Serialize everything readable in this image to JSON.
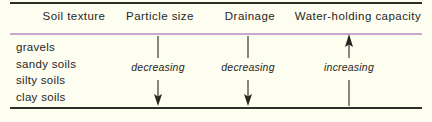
{
  "figure": {
    "background_color": "#fdfdf0",
    "rule_color": "#2e2e28",
    "accent_rule_color": "#c9a8cd",
    "text_color": "#26261f"
  },
  "columns": [
    {
      "header": "Soil texture"
    },
    {
      "header": "Particle size"
    },
    {
      "header": "Drainage"
    },
    {
      "header": "Water-holding capacity"
    }
  ],
  "soil_types": [
    "gravels",
    "sandy soils",
    "silty soils",
    "clay soils"
  ],
  "trends": [
    {
      "label": "decreasing",
      "direction": "down"
    },
    {
      "label": "decreasing",
      "direction": "down"
    },
    {
      "label": "increasing",
      "direction": "up"
    }
  ]
}
